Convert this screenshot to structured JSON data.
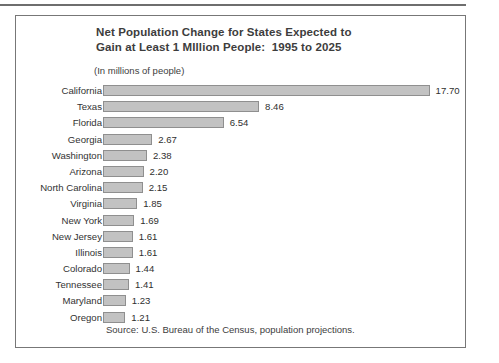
{
  "figure": {
    "title_line1": "Net Population Change for States Expected to",
    "title_line2": "Gain at Least 1 MIllion People:  1995 to 2025",
    "subtitle": "(In millions of people)",
    "source": "Source:  U.S. Bureau of the Census, population projections."
  },
  "chart_data": {
    "type": "bar",
    "orientation": "horizontal",
    "title": "Net Population Change for States Expected to Gain at Least 1 MIllion People:  1995 to 2025",
    "subtitle": "(In millions of people)",
    "xlabel": "",
    "ylabel": "",
    "unit": "millions of people",
    "grid": false,
    "legend": "none",
    "xlim": [
      0,
      17.7
    ],
    "categories": [
      "California",
      "Texas",
      "Florida",
      "Georgia",
      "Washington",
      "Arizona",
      "North Carolina",
      "Virginia",
      "New York",
      "New Jersey",
      "Illinois",
      "Colorado",
      "Tennessee",
      "Maryland",
      "Oregon"
    ],
    "values": [
      17.7,
      8.46,
      6.54,
      2.67,
      2.38,
      2.2,
      2.15,
      1.85,
      1.69,
      1.61,
      1.61,
      1.44,
      1.41,
      1.23,
      1.21
    ],
    "value_labels": [
      "17.70",
      "8.46",
      "6.54",
      "2.67",
      "2.38",
      "2.20",
      "2.15",
      "1.85",
      "1.69",
      "1.61",
      "1.61",
      "1.44",
      "1.41",
      "1.23",
      "1.21"
    ],
    "bar_fill_color": "#c2c2c2",
    "bar_border_color": "#8f8f8f",
    "source": "Source:  U.S. Bureau of the Census, population projections."
  }
}
